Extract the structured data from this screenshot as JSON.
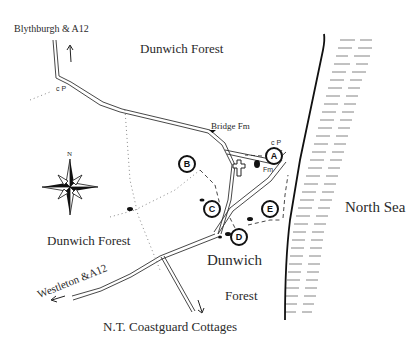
{
  "map": {
    "labels": {
      "blythburgh": "Blythburgh & A12",
      "dunwich_forest_north": "Dunwich Forest",
      "dunwich_forest_west": "Dunwich Forest",
      "bridge_farm": "Bridge Fm",
      "north_sea": "North Sea",
      "dunwich": "Dunwich",
      "forest_south": "Forest",
      "westleton": "Westleton &A12",
      "coastguard_cottages": "N.T. Coastguard Cottages",
      "car_park_north": "c P",
      "car_park_a": "c P",
      "fm_small": "Fm",
      "compass_north": "N"
    },
    "waypoints": [
      {
        "id": "A",
        "label": "A"
      },
      {
        "id": "B",
        "label": "B"
      },
      {
        "id": "C",
        "label": "C"
      },
      {
        "id": "D",
        "label": "D"
      },
      {
        "id": "E",
        "label": "E"
      }
    ],
    "icons": {
      "compass": "compass-rose-icon",
      "church": "church-cross-icon",
      "north_arrow": "arrow-up-icon",
      "south_arrow": "arrow-down-icon",
      "west_arrow": "arrow-left-icon"
    },
    "colors": {
      "ink": "#222222",
      "paper": "#ffffff",
      "sea_hatch": "#555555"
    }
  }
}
